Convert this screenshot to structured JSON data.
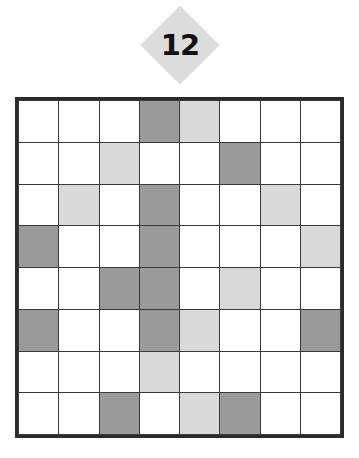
{
  "puzzle": {
    "badge": {
      "shape": "diamond",
      "value": "12",
      "fill_color": "#dcdcdc",
      "text_color": "#111111"
    },
    "grid": {
      "rows": 8,
      "columns": 8,
      "border_color": "#2b2b2b",
      "line_color": "#3a3a3a",
      "empty_color": "#ffffff",
      "legend": [
        {
          "key": "dark",
          "label": "dark shaded cell",
          "color": "#9a9a9a"
        },
        {
          "key": "light",
          "label": "light shaded cell",
          "color": "#d9d9d9"
        },
        {
          "key": "none",
          "label": "empty cell",
          "color": "#ffffff"
        }
      ],
      "cells": [
        [
          "none",
          "none",
          "none",
          "dark",
          "light",
          "none",
          "none",
          "none"
        ],
        [
          "none",
          "none",
          "light",
          "none",
          "none",
          "dark",
          "none",
          "none"
        ],
        [
          "none",
          "light",
          "none",
          "dark",
          "none",
          "none",
          "light",
          "none"
        ],
        [
          "dark",
          "none",
          "none",
          "dark",
          "none",
          "none",
          "none",
          "light"
        ],
        [
          "none",
          "none",
          "dark",
          "dark",
          "none",
          "light",
          "none",
          "none"
        ],
        [
          "dark",
          "none",
          "none",
          "dark",
          "light",
          "none",
          "none",
          "dark"
        ],
        [
          "none",
          "none",
          "none",
          "light",
          "none",
          "none",
          "none",
          "none"
        ],
        [
          "none",
          "none",
          "dark",
          "none",
          "light",
          "dark",
          "none",
          "none"
        ]
      ]
    }
  }
}
